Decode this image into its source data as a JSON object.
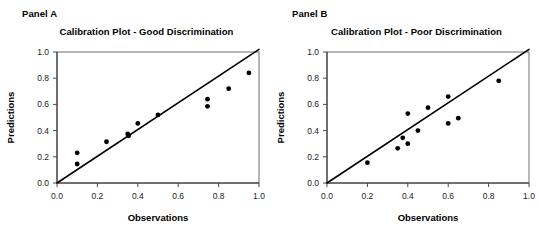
{
  "figure": {
    "width": 539,
    "height": 241,
    "background": "#ffffff"
  },
  "panels": [
    {
      "key": "panel_a",
      "label": "Panel A",
      "title": "Calibration Plot - Good Discrimination"
    },
    {
      "key": "panel_b",
      "label": "Panel B",
      "title": "Calibration Plot - Poor Discrimination"
    }
  ],
  "chart_data": [
    {
      "type": "scatter",
      "panel_label": "Panel A",
      "title": "Calibration Plot - Good Discrimination",
      "xlabel": "Observations",
      "ylabel": "Predictions",
      "xlim": [
        0.0,
        1.0
      ],
      "ylim": [
        0.0,
        1.0
      ],
      "xticks": [
        0.0,
        0.2,
        0.4,
        0.6,
        0.8,
        1.0
      ],
      "yticks": [
        0.0,
        0.2,
        0.4,
        0.6,
        0.8,
        1.0
      ],
      "xtick_labels": [
        "0.0",
        "0.2",
        "0.4",
        "0.6",
        "0.8",
        "1.0"
      ],
      "ytick_labels": [
        "0.0",
        "0.2",
        "0.4",
        "0.6",
        "0.8",
        "1.0"
      ],
      "grid": false,
      "legend": null,
      "marker_color": "#000000",
      "line_color": "#000000",
      "series": [
        {
          "name": "Calibration points",
          "x": [
            0.1,
            0.1,
            0.245,
            0.35,
            0.355,
            0.4,
            0.5,
            0.745,
            0.745,
            0.85,
            0.95
          ],
          "y": [
            0.23,
            0.145,
            0.315,
            0.375,
            0.36,
            0.455,
            0.52,
            0.64,
            0.585,
            0.72,
            0.84
          ]
        }
      ],
      "reference_line": {
        "name": "Ideal calibration line",
        "x": [
          0.0,
          1.0
        ],
        "y": [
          0.0,
          1.02
        ]
      }
    },
    {
      "type": "scatter",
      "panel_label": "Panel B",
      "title": "Calibration Plot - Poor Discrimination",
      "xlabel": "Observations",
      "ylabel": "Predictions",
      "xlim": [
        0.0,
        1.0
      ],
      "ylim": [
        0.0,
        1.0
      ],
      "xticks": [
        0.0,
        0.2,
        0.4,
        0.6,
        0.8,
        1.0
      ],
      "yticks": [
        0.0,
        0.2,
        0.4,
        0.6,
        0.8,
        1.0
      ],
      "xtick_labels": [
        "0.0",
        "0.2",
        "0.4",
        "0.6",
        "0.8",
        "1.0"
      ],
      "ytick_labels": [
        "0.0",
        "0.2",
        "0.4",
        "0.6",
        "0.8",
        "1.0"
      ],
      "grid": false,
      "legend": null,
      "marker_color": "#000000",
      "line_color": "#000000",
      "series": [
        {
          "name": "Calibration points",
          "x": [
            0.2,
            0.35,
            0.375,
            0.4,
            0.4,
            0.45,
            0.5,
            0.6,
            0.6,
            0.65,
            0.85
          ],
          "y": [
            0.155,
            0.265,
            0.345,
            0.53,
            0.3,
            0.4,
            0.575,
            0.66,
            0.455,
            0.495,
            0.78
          ]
        }
      ],
      "reference_line": {
        "name": "Ideal calibration line",
        "x": [
          0.0,
          1.0
        ],
        "y": [
          0.0,
          1.02
        ]
      }
    }
  ]
}
